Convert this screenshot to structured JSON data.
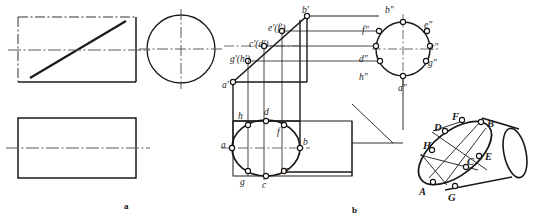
{
  "figure": {
    "title": "",
    "captions": [
      {
        "name": "caption-a",
        "text": "a",
        "x": 124,
        "y": 201
      },
      {
        "name": "caption-b",
        "text": "b",
        "x": 352,
        "y": 205
      }
    ]
  },
  "view_a": {
    "name": "orthographic-views",
    "description": "Front view with inclined cut, left side view circle, top view rectangle",
    "front_view": {
      "x": 18,
      "y": 17,
      "w": 118,
      "h": 65
    },
    "side_view_circle": {
      "cx": 181,
      "cy": 49,
      "r": 34
    },
    "top_view": {
      "x": 18,
      "y": 118,
      "w": 118,
      "h": 60
    }
  },
  "view_b": {
    "name": "projection-construction",
    "description": "Three-view projection of a cylinder cut by an inclined plane producing an ellipse, plus pictorial cylinder",
    "labels_front": [
      {
        "name": "point-label-b-prime",
        "text": "b′",
        "x": 302,
        "y": 6
      },
      {
        "name": "point-label-ef-prime",
        "text": "e′(f′)",
        "x": 268,
        "y": 24
      },
      {
        "name": "point-label-cd-prime",
        "text": "c′(d′)",
        "x": 249,
        "y": 40
      },
      {
        "name": "point-label-gh-prime",
        "text": "g′(h′)",
        "x": 230,
        "y": 55
      },
      {
        "name": "point-label-a-prime",
        "text": "a′",
        "x": 222,
        "y": 81
      }
    ],
    "labels_side": [
      {
        "name": "point-label-b-dprime",
        "text": "b″",
        "x": 385,
        "y": 6
      },
      {
        "name": "point-label-f-dprime",
        "text": "f″",
        "x": 362,
        "y": 26
      },
      {
        "name": "point-label-e-dprime",
        "text": "e″",
        "x": 424,
        "y": 21
      },
      {
        "name": "point-label-c-dprime",
        "text": "c″",
        "x": 430,
        "y": 43
      },
      {
        "name": "point-label-d-dprime",
        "text": "d″",
        "x": 359,
        "y": 55
      },
      {
        "name": "point-label-g-dprime",
        "text": "g″",
        "x": 428,
        "y": 59
      },
      {
        "name": "point-label-h-dprime",
        "text": "h″",
        "x": 359,
        "y": 73
      },
      {
        "name": "point-label-a-dprime",
        "text": "a″",
        "x": 398,
        "y": 84
      }
    ],
    "labels_top": [
      {
        "name": "point-label-h",
        "text": "h",
        "x": 238,
        "y": 112
      },
      {
        "name": "point-label-d",
        "text": "d",
        "x": 264,
        "y": 108
      },
      {
        "name": "point-label-f",
        "text": "f",
        "x": 277,
        "y": 128
      },
      {
        "name": "point-label-a",
        "text": "a",
        "x": 221,
        "y": 141
      },
      {
        "name": "point-label-b",
        "text": "b",
        "x": 303,
        "y": 138
      },
      {
        "name": "point-label-g",
        "text": "g",
        "x": 240,
        "y": 178
      },
      {
        "name": "point-label-c",
        "text": "c",
        "x": 262,
        "y": 181
      },
      {
        "name": "point-label-e",
        "text": "e",
        "x": 285,
        "y": 166
      }
    ],
    "labels_pictorial": [
      {
        "name": "point-label-F-upper",
        "text": "F",
        "x": 452,
        "y": 112
      },
      {
        "name": "point-label-B-upper",
        "text": "B",
        "x": 487,
        "y": 119
      },
      {
        "name": "point-label-D-upper",
        "text": "D",
        "x": 434,
        "y": 123
      },
      {
        "name": "point-label-H-upper",
        "text": "H",
        "x": 423,
        "y": 141
      },
      {
        "name": "point-label-C-upper",
        "text": "C",
        "x": 467,
        "y": 157
      },
      {
        "name": "point-label-E-upper",
        "text": "E",
        "x": 485,
        "y": 152
      },
      {
        "name": "point-label-A-upper",
        "text": "A",
        "x": 419,
        "y": 187
      },
      {
        "name": "point-label-G-upper",
        "text": "G",
        "x": 448,
        "y": 193
      }
    ]
  },
  "style": {
    "line_color": "#1a1a1a",
    "center_line_color": "#555555",
    "node_fill": "#ffffff",
    "background": "#ffffff"
  }
}
